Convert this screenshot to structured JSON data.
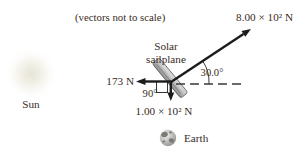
{
  "figure": {
    "note": "(vectors not to scale)",
    "labels": {
      "sun": "Sun",
      "earth": "Earth",
      "sailplane_line1": "Solar",
      "sailplane_line2": "sailplane"
    },
    "forces": {
      "thrust": "8.00 × 10² N",
      "left": "173 N",
      "down": "1.00 × 10² N"
    },
    "angles": {
      "incline": "30.0°",
      "right_angle": "90°"
    },
    "colors": {
      "text": "#392c26",
      "arrow": "#1c1c1c",
      "sail_gray": "#b5b5b5",
      "sun_glow": "#edeade",
      "earth_gray": "#9a9a98"
    }
  }
}
